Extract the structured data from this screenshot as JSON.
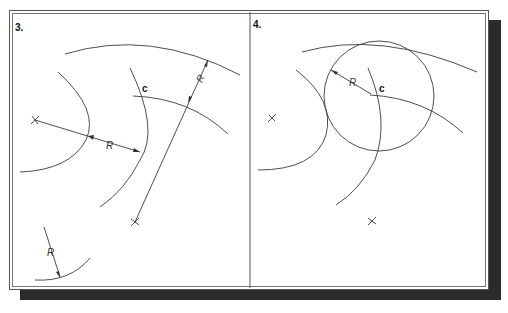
{
  "figure": {
    "type": "geometric-construction",
    "panels": [
      {
        "id": "panel-3",
        "step_label": "3.",
        "intersection_label": "c",
        "radius_labels": [
          "R",
          "R",
          "R"
        ]
      },
      {
        "id": "panel-4",
        "step_label": "4.",
        "intersection_label": "c",
        "radius_labels": [
          "R"
        ]
      }
    ]
  },
  "colors": {
    "line": "#3a3a3a",
    "frame": "#555555",
    "shadow": "#2b2b2b",
    "background": "#ffffff"
  }
}
